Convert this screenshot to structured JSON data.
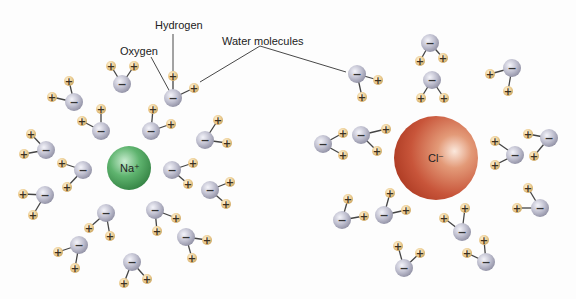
{
  "labels": {
    "hydrogen": "Hydrogen",
    "oxygen": "Oxygen",
    "water_molecules": "Water molecules"
  },
  "ions": {
    "sodium": {
      "label": "Na⁺",
      "color": "#3f9a52",
      "cx": 129,
      "cy": 168,
      "r": 22
    },
    "chloride": {
      "label": "Cl⁻",
      "color": "#c0432a",
      "cx": 436,
      "cy": 158,
      "r": 42
    }
  },
  "colors": {
    "oxygen_atom": "#b9b9c9",
    "hydrogen_atom": "#e6c88a",
    "bond": "#444444",
    "text": "#222222"
  },
  "symbols": {
    "oxygen_charge": "−",
    "hydrogen_charge": "+"
  },
  "water_molecules": {
    "around_sodium": [
      {
        "o": [
          122,
          84
        ],
        "h": [
          [
            111,
            66
          ],
          [
            134,
            66
          ]
        ]
      },
      {
        "o": [
          74,
          102
        ],
        "h": [
          [
            69,
            81
          ],
          [
            52,
            97
          ]
        ]
      },
      {
        "o": [
          101,
          131
        ],
        "h": [
          [
            101,
            109
          ],
          [
            82,
            121
          ]
        ]
      },
      {
        "o": [
          151,
          131
        ],
        "h": [
          [
            153,
            109
          ],
          [
            171,
            124
          ]
        ]
      },
      {
        "o": [
          173,
          98
        ],
        "h": [
          [
            173,
            76
          ],
          [
            194,
            88
          ]
        ]
      },
      {
        "o": [
          205,
          140
        ],
        "h": [
          [
            218,
            120
          ],
          [
            227,
            143
          ]
        ]
      },
      {
        "o": [
          46,
          150
        ],
        "h": [
          [
            31,
            134
          ],
          [
            24,
            154
          ]
        ]
      },
      {
        "o": [
          83,
          170
        ],
        "h": [
          [
            62,
            163
          ],
          [
            67,
            187
          ]
        ]
      },
      {
        "o": [
          45,
          195
        ],
        "h": [
          [
            23,
            194
          ],
          [
            33,
            215
          ]
        ]
      },
      {
        "o": [
          172,
          170
        ],
        "h": [
          [
            193,
            163
          ],
          [
            188,
            184
          ]
        ]
      },
      {
        "o": [
          210,
          190
        ],
        "h": [
          [
            230,
            182
          ],
          [
            226,
            204
          ]
        ]
      },
      {
        "o": [
          155,
          210
        ],
        "h": [
          [
            176,
            218
          ],
          [
            157,
            231
          ]
        ]
      },
      {
        "o": [
          186,
          237
        ],
        "h": [
          [
            207,
            240
          ],
          [
            192,
            258
          ]
        ]
      },
      {
        "o": [
          106,
          213
        ],
        "h": [
          [
            89,
            228
          ],
          [
            110,
            236
          ]
        ]
      },
      {
        "o": [
          79,
          245
        ],
        "h": [
          [
            58,
            252
          ],
          [
            75,
            268
          ]
        ]
      },
      {
        "o": [
          132,
          262
        ],
        "h": [
          [
            124,
            283
          ],
          [
            147,
            279
          ]
        ]
      }
    ],
    "around_chloride": [
      {
        "o": [
          357,
          74
        ],
        "h": [
          [
            378,
            80
          ],
          [
            362,
            97
          ]
        ]
      },
      {
        "o": [
          430,
          43
        ],
        "h": [
          [
            420,
            61
          ],
          [
            443,
            58
          ]
        ]
      },
      {
        "o": [
          432,
          80
        ],
        "h": [
          [
            421,
            98
          ],
          [
            444,
            98
          ]
        ]
      },
      {
        "o": [
          512,
          68
        ],
        "h": [
          [
            490,
            74
          ],
          [
            508,
            91
          ]
        ]
      },
      {
        "o": [
          323,
          144
        ],
        "h": [
          [
            343,
            133
          ],
          [
            343,
            155
          ]
        ]
      },
      {
        "o": [
          361,
          135
        ],
        "h": [
          [
            386,
            129
          ],
          [
            377,
            151
          ]
        ]
      },
      {
        "o": [
          515,
          155
        ],
        "h": [
          [
            495,
            141
          ],
          [
            495,
            165
          ]
        ]
      },
      {
        "o": [
          549,
          138
        ],
        "h": [
          [
            528,
            134
          ],
          [
            534,
            156
          ]
        ]
      },
      {
        "o": [
          540,
          208
        ],
        "h": [
          [
            528,
            188
          ],
          [
            517,
            208
          ]
        ]
      },
      {
        "o": [
          342,
          220
        ],
        "h": [
          [
            348,
            199
          ],
          [
            364,
            216
          ]
        ]
      },
      {
        "o": [
          384,
          215
        ],
        "h": [
          [
            390,
            193
          ],
          [
            406,
            210
          ]
        ]
      },
      {
        "o": [
          462,
          232
        ],
        "h": [
          [
            465,
            208
          ],
          [
            444,
            218
          ]
        ]
      },
      {
        "o": [
          404,
          268
        ],
        "h": [
          [
            398,
            246
          ],
          [
            420,
            253
          ]
        ]
      },
      {
        "o": [
          486,
          262
        ],
        "h": [
          [
            484,
            240
          ],
          [
            467,
            253
          ]
        ]
      }
    ]
  }
}
